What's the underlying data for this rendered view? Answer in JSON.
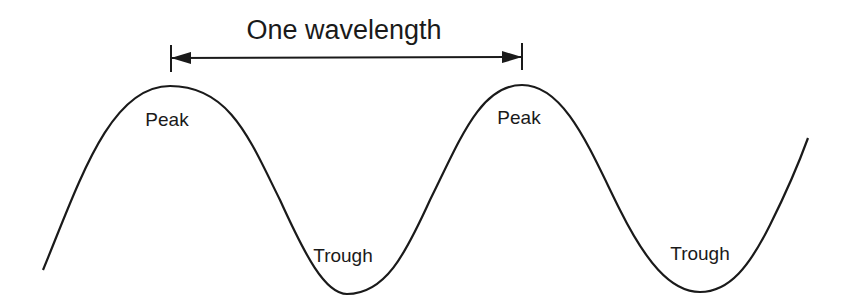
{
  "diagram": {
    "title": "One wavelength",
    "labels": {
      "peak_1": "Peak",
      "peak_2": "Peak",
      "trough_1": "Trough",
      "trough_2": "Trough"
    },
    "colors": {
      "stroke": "#1a1a1a",
      "background": "#ffffff"
    }
  }
}
